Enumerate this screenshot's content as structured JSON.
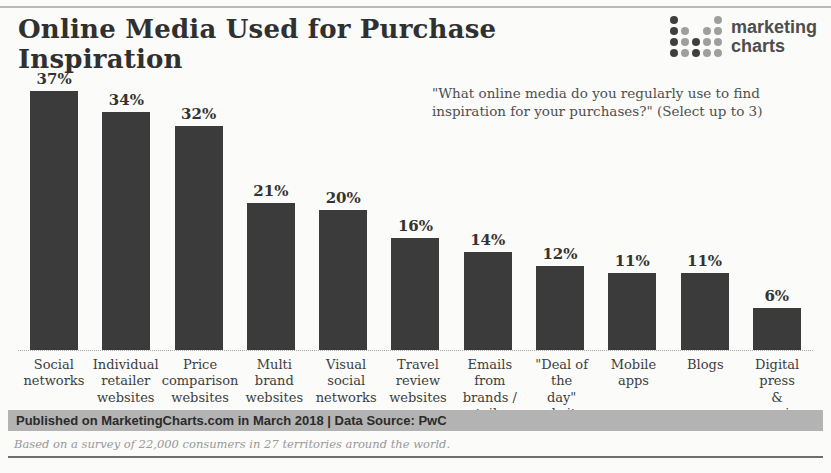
{
  "header": {
    "title": "Online Media Used for Purchase Inspiration"
  },
  "logo": {
    "line1": "marketing",
    "line2": "charts",
    "icon": "dot-bar-chart-icon",
    "dots": [
      [
        2,
        0,
        0,
        0,
        1
      ],
      [
        2,
        1,
        0,
        1,
        1
      ],
      [
        2,
        1,
        2,
        1,
        1
      ],
      [
        2,
        1,
        2,
        1,
        1
      ]
    ]
  },
  "question": "\"What online media do you regularly use to find inspiration for your purchases?\" (Select up to 3)",
  "chart_data": {
    "type": "bar",
    "title": "Online Media Used for Purchase Inspiration",
    "categories": [
      "Social\nnetworks",
      "Individual\nretailer\nwebsites",
      "Price\ncomparison\nwebsites",
      "Multi brand\nwebsites",
      "Visual social\nnetworks",
      "Travel\nreview\nwebsites",
      "Emails from\nbrands /\nretailers",
      "\"Deal of the\nday\"\nwebsites",
      "Mobile apps",
      "Blogs",
      "Digital press\n& magazines"
    ],
    "values": [
      37,
      34,
      32,
      21,
      20,
      16,
      14,
      12,
      11,
      11,
      6
    ],
    "value_suffix": "%",
    "bar_color": "#3b3b3b",
    "xlabel": "",
    "ylabel": "",
    "ylim": [
      0,
      40
    ],
    "grid": false,
    "legend": "none"
  },
  "footer": {
    "published": "Published on MarketingCharts.com in March 2018 | Data Source: PwC",
    "note": "Based on a survey of 22,000 consumers in 27 territories around the world."
  }
}
